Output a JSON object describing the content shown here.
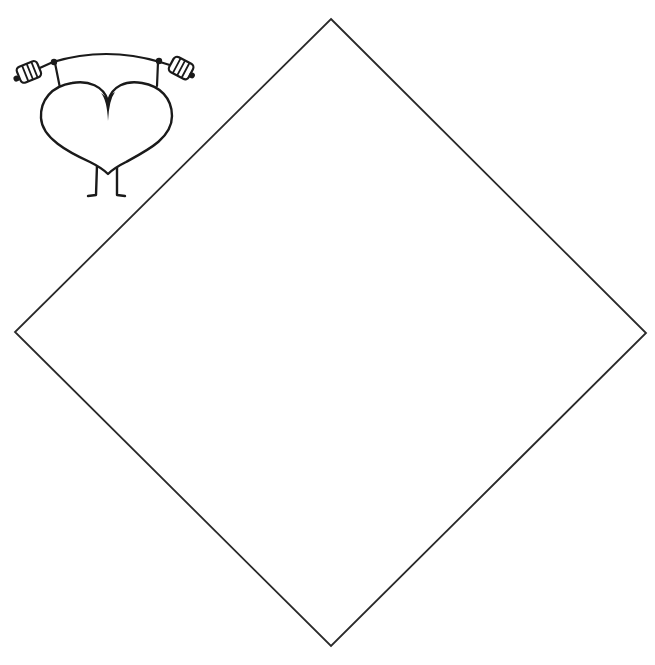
{
  "page": {
    "background": "#ffffff"
  },
  "illustration": {
    "label": "Heart lifting a barbell",
    "stroke_color": "#1a1a1a",
    "fill_color": "#ffffff"
  },
  "diamond": {
    "label": "Blank diamond shape",
    "stroke_color": "#2a2a2a",
    "fill_color": "#ffffff",
    "vertices": {
      "top": [
        331,
        19
      ],
      "right": [
        646,
        333
      ],
      "bottom": [
        331,
        646
      ],
      "left": [
        15,
        332
      ]
    }
  }
}
